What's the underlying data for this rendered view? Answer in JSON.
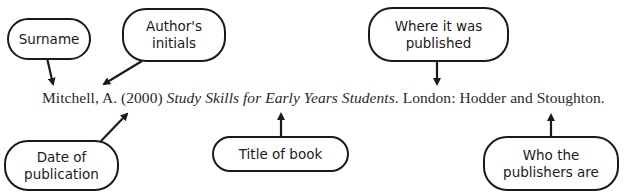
{
  "diagram": {
    "citation": {
      "author": "Mitchell, A.",
      "year": "(2000)",
      "title": "Study Skills for Early Years Students",
      "after_title": ".",
      "place": "London:",
      "publisher": "Hodder and Stoughton."
    },
    "labels": {
      "surname": "Surname",
      "initials": "Author's\ninitials",
      "place": "Where it was\npublished",
      "date": "Date of\npublication",
      "title": "Title of book",
      "publisher": "Who the\npublishers are"
    },
    "colors": {
      "stroke": "#1a1a1a",
      "text": "#2a2a2a",
      "background": "#ffffff"
    }
  }
}
